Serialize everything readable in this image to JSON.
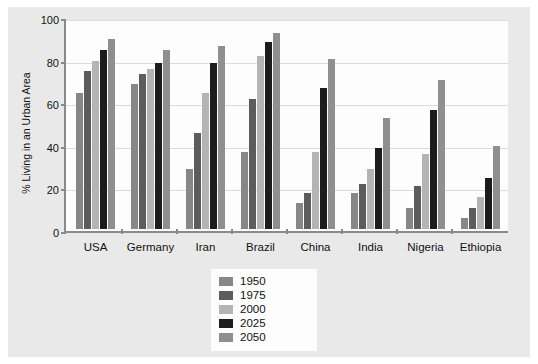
{
  "chart_data": {
    "type": "bar",
    "title": "",
    "xlabel": "",
    "ylabel": "% Living in an Urban Area",
    "ylim": [
      0,
      100
    ],
    "yticks": [
      0,
      20,
      40,
      60,
      80,
      100
    ],
    "grid": true,
    "legend_position": "bottom-center",
    "categories": [
      "USA",
      "Germany",
      "Iran",
      "Brazil",
      "China",
      "India",
      "Nigeria",
      "Ethiopia"
    ],
    "series": [
      {
        "name": "1950",
        "color": "#878787",
        "values": [
          64,
          68,
          28,
          36,
          12,
          17,
          10,
          5
        ]
      },
      {
        "name": "1975",
        "color": "#5c5c5c",
        "values": [
          74,
          73,
          45,
          61,
          17,
          21,
          20,
          10
        ]
      },
      {
        "name": "2000",
        "color": "#b4b4b4",
        "values": [
          79,
          75,
          64,
          81,
          36,
          28,
          35,
          15
        ]
      },
      {
        "name": "2025",
        "color": "#1c1c1c",
        "values": [
          84,
          78,
          78,
          88,
          66,
          38,
          56,
          24
        ]
      },
      {
        "name": "2050",
        "color": "#8f8f8f",
        "values": [
          89,
          84,
          86,
          92,
          80,
          52,
          70,
          39
        ]
      }
    ]
  },
  "legend": {
    "items": [
      {
        "label": "1950",
        "color": "#878787"
      },
      {
        "label": "1975",
        "color": "#5c5c5c"
      },
      {
        "label": "2000",
        "color": "#b4b4b4"
      },
      {
        "label": "2025",
        "color": "#1c1c1c"
      },
      {
        "label": "2050",
        "color": "#8f8f8f"
      }
    ]
  },
  "colors": {
    "frame_background": "#e9e9e9",
    "plot_background": "#fdfdfd",
    "axis": "#8a8a8a",
    "gridline": "#dcdcdc",
    "text": "#111111"
  }
}
